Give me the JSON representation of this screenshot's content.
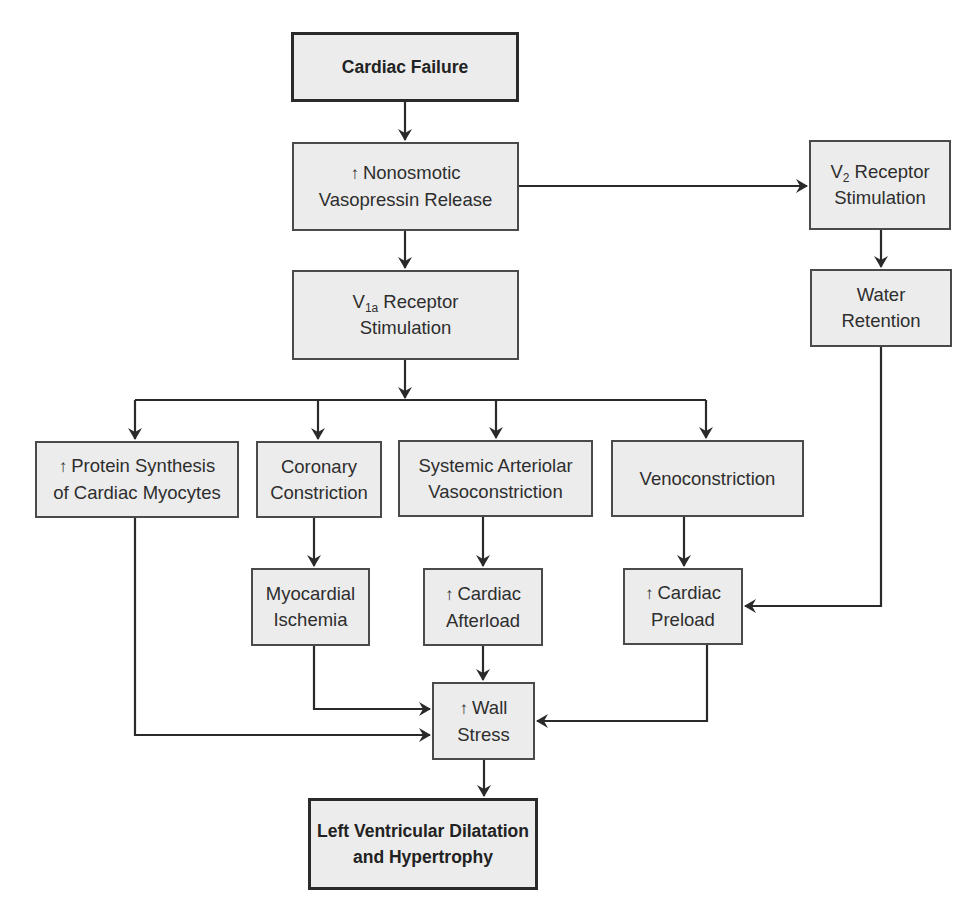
{
  "diagram": {
    "type": "flowchart",
    "colors": {
      "box_fill": "#ececec",
      "box_border": "#4a4a4a",
      "arrow": "#2a2a2a",
      "text": "#2e2e2e",
      "background": "#ffffff"
    },
    "icons": {
      "increase": "↑"
    },
    "nodes": {
      "cardiac_failure": {
        "line1": "Cardiac Failure"
      },
      "vasopressin_release": {
        "prefix": "↑",
        "line1": "Nonosmotic",
        "line2": "Vasopressin Release"
      },
      "v2_receptor": {
        "main": "V",
        "sub": "2",
        "line1_rest": " Receptor",
        "line2": "Stimulation"
      },
      "water_retention": {
        "line1": "Water",
        "line2": "Retention"
      },
      "v1a_receptor": {
        "main": "V",
        "sub": "1a",
        "line1_rest": " Receptor",
        "line2": "Stimulation"
      },
      "protein_synthesis": {
        "prefix": "↑",
        "line1": "Protein Synthesis",
        "line2": "of Cardiac Myocytes"
      },
      "coronary_constriction": {
        "line1": "Coronary",
        "line2": "Constriction"
      },
      "systemic_vasoconstriction": {
        "line1": "Systemic Arteriolar",
        "line2": "Vasoconstriction"
      },
      "venoconstriction": {
        "line1": "Venoconstriction"
      },
      "myocardial_ischemia": {
        "line1": "Myocardial",
        "line2": "Ischemia"
      },
      "cardiac_afterload": {
        "prefix": "↑",
        "line1": "Cardiac",
        "line2": "Afterload"
      },
      "cardiac_preload": {
        "prefix": "↑",
        "line1": "Cardiac",
        "line2": "Preload"
      },
      "wall_stress": {
        "prefix": "↑",
        "line1": "Wall",
        "line2": "Stress"
      },
      "lv_dilatation": {
        "line1": "Left Ventricular Dilatation",
        "line2": "and Hypertrophy"
      }
    },
    "edges": [
      [
        "cardiac_failure",
        "vasopressin_release"
      ],
      [
        "vasopressin_release",
        "v2_receptor"
      ],
      [
        "vasopressin_release",
        "v1a_receptor"
      ],
      [
        "v2_receptor",
        "water_retention"
      ],
      [
        "v1a_receptor",
        "protein_synthesis"
      ],
      [
        "v1a_receptor",
        "coronary_constriction"
      ],
      [
        "v1a_receptor",
        "systemic_vasoconstriction"
      ],
      [
        "v1a_receptor",
        "venoconstriction"
      ],
      [
        "coronary_constriction",
        "myocardial_ischemia"
      ],
      [
        "systemic_vasoconstriction",
        "cardiac_afterload"
      ],
      [
        "venoconstriction",
        "cardiac_preload"
      ],
      [
        "water_retention",
        "cardiac_preload"
      ],
      [
        "protein_synthesis",
        "wall_stress"
      ],
      [
        "myocardial_ischemia",
        "wall_stress"
      ],
      [
        "cardiac_afterload",
        "wall_stress"
      ],
      [
        "cardiac_preload",
        "wall_stress"
      ],
      [
        "wall_stress",
        "lv_dilatation"
      ]
    ]
  }
}
